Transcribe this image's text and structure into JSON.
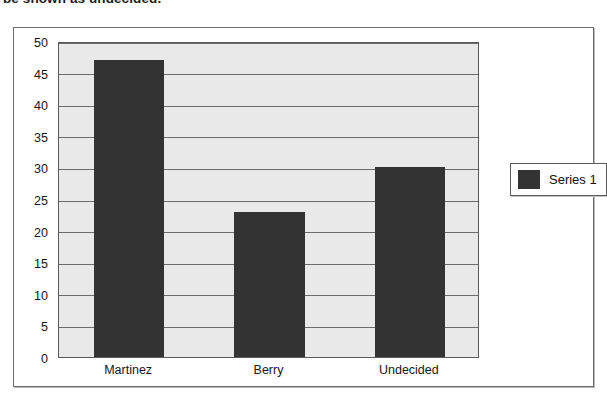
{
  "caption": "be shown as undecided.",
  "legend": {
    "entries": [
      {
        "label": "Series 1",
        "color": "#333333",
        "swatch_icon": "legend-color-swatch-icon"
      }
    ],
    "position": "right"
  },
  "chart_data": {
    "type": "bar",
    "title": "",
    "subtitle": "",
    "xlabel": "",
    "ylabel": "",
    "categories": [
      "Martinez",
      "Berry",
      "Undecided"
    ],
    "values": [
      47,
      23,
      30
    ],
    "series": [
      {
        "name": "Series 1",
        "color": "#333333",
        "values": [
          47,
          23,
          30
        ]
      }
    ],
    "ylim": [
      0,
      50
    ],
    "ytick_step": 5,
    "yticks": [
      "0",
      "5",
      "10",
      "15",
      "20",
      "25",
      "30",
      "35",
      "40",
      "45",
      "50"
    ],
    "grid": "horizontal",
    "plot_background": "#e9e9e9",
    "frame_background": "#ffffff",
    "legend_position": "right"
  }
}
